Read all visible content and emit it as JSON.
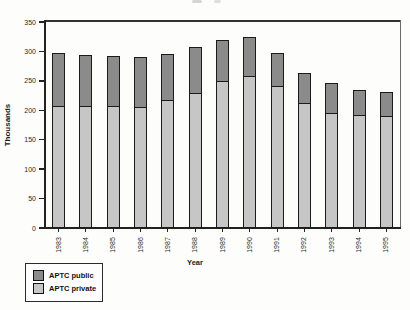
{
  "chart_data": {
    "type": "bar",
    "stacked": true,
    "title": "",
    "xlabel": "Year",
    "ylabel": "Thousands",
    "ylim": [
      0,
      350
    ],
    "y_ticks": [
      0,
      50,
      100,
      150,
      200,
      250,
      300,
      350
    ],
    "grid": false,
    "legend_position": "bottom-left",
    "categories": [
      "1983",
      "1984",
      "1985",
      "1986",
      "1987",
      "1988",
      "1989",
      "1990",
      "1991",
      "1992",
      "1993",
      "1994",
      "1995"
    ],
    "series": [
      {
        "name": "APTC private",
        "color": "#c6c6c6",
        "values": [
          207,
          207,
          207,
          206,
          218,
          230,
          249,
          258,
          241,
          212,
          195,
          192,
          191
        ]
      },
      {
        "name": "APTC public",
        "color": "#8b8b8b",
        "values": [
          91,
          87,
          85,
          84,
          78,
          77,
          70,
          66,
          57,
          51,
          51,
          43,
          40
        ]
      }
    ],
    "totals": [
      298,
      294,
      292,
      290,
      296,
      307,
      319,
      324,
      298,
      263,
      246,
      235,
      231
    ]
  }
}
